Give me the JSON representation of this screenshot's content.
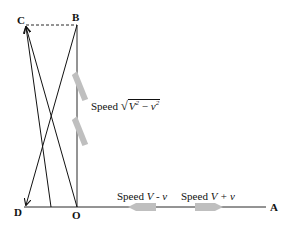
{
  "diagram": {
    "points": {
      "A": "A",
      "B": "B",
      "C": "C",
      "D": "D",
      "O": "O"
    },
    "labels": {
      "speed_word": "Speed",
      "cross_V": "V",
      "cross_v": "v",
      "cross_exp": "2",
      "cross_minus": " − ",
      "downstream_expr": "V + v",
      "upstream_expr": "V - v"
    },
    "colors": {
      "line": "#111111",
      "boat": "#bfbfbf",
      "background": "#ffffff"
    }
  }
}
